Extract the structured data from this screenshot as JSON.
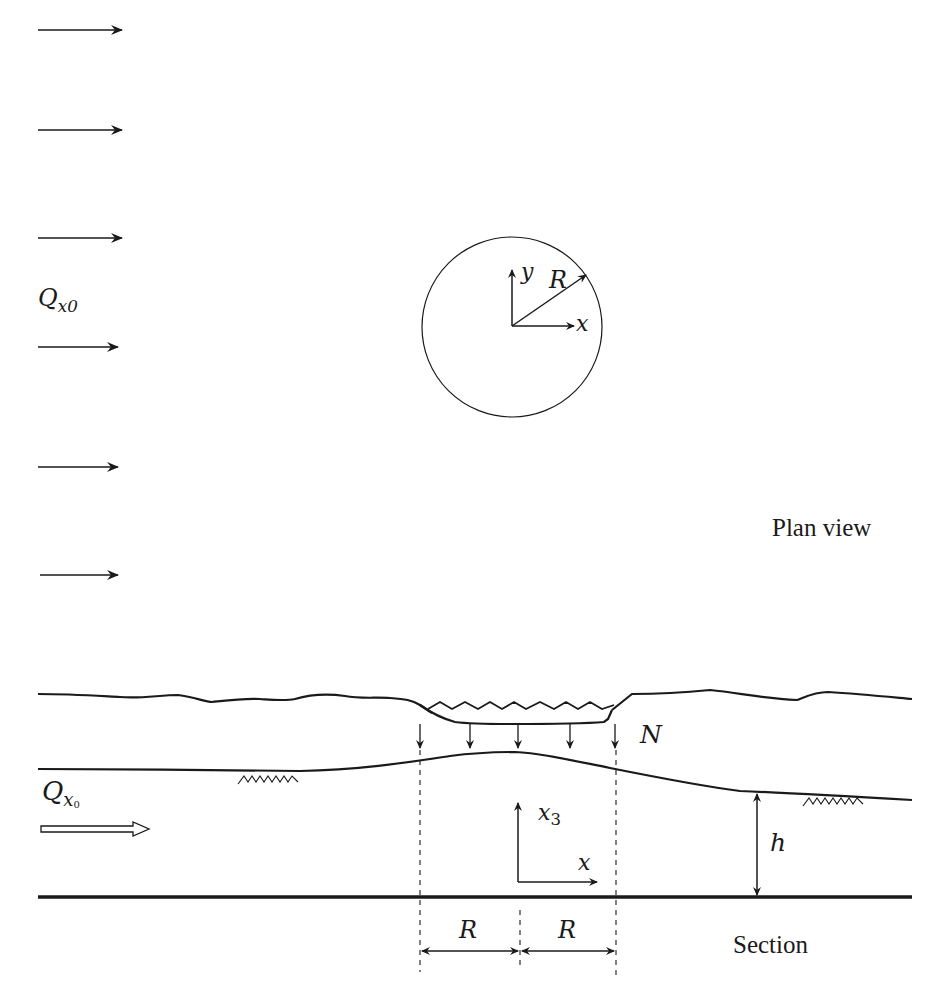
{
  "plan_view": {
    "caption": "Plan view",
    "flow_label": {
      "symbol": "Q",
      "subscript": "x0"
    },
    "flow_arrow_count": 6,
    "flow_arrow_y": [
      30,
      130,
      238,
      347,
      467,
      575
    ],
    "recharge_area": {
      "shape": "circle",
      "center": [
        512,
        327
      ],
      "radius": 90
    },
    "axes": {
      "x_label": "x",
      "y_label": "y",
      "radius_label": "R"
    }
  },
  "section": {
    "caption": "Section",
    "flow_label": {
      "symbol": "Q",
      "subscript": "x",
      "subsubscript": "0"
    },
    "recharge_label": "N",
    "thickness_label": "h",
    "axes": {
      "x_label": "x",
      "vertical_label_symbol": "x",
      "vertical_label_subscript": "3"
    },
    "dimension_labels": [
      "R",
      "R"
    ],
    "recharge_arrow_count": 5
  },
  "colors": {
    "ink": "#1a1a1a",
    "background": "#ffffff"
  }
}
